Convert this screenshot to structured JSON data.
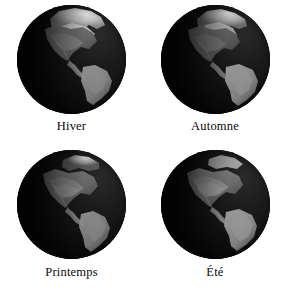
{
  "figure": {
    "background_color": "#ffffff",
    "layout": "2x2 grid of Earth globes with captions",
    "globe_count": 4
  },
  "panels": [
    {
      "id": "panel-hiver",
      "caption": "Hiver",
      "season_en": "Winter",
      "position": "top-left",
      "view": "Americas / Western Hemisphere",
      "snow_cover": "maximum",
      "description": "Globe with extensive bright white snow cover across North America and the Arctic",
      "illumination": "lit from upper right, dark limb on the left"
    },
    {
      "id": "panel-automne",
      "caption": "Automne",
      "season_en": "Autumn",
      "position": "top-right",
      "view": "Americas / Western Hemisphere",
      "snow_cover": "moderate",
      "description": "Globe with partial snow over northern Canada and the Arctic",
      "illumination": "lit from upper right, dark limb on the left"
    },
    {
      "id": "panel-printemps",
      "caption": "Printemps",
      "season_en": "Spring",
      "position": "bottom-left",
      "view": "Americas / Western Hemisphere",
      "snow_cover": "light",
      "description": "Globe with reduced snow, greening mid-latitude land",
      "illumination": "lit from upper right, dark limb on the left"
    },
    {
      "id": "panel-ete",
      "caption": "Été",
      "season_en": "Summer",
      "position": "bottom-right",
      "view": "Americas / Western Hemisphere",
      "snow_cover": "minimum",
      "description": "Globe with almost no snow cover, brightest vegetated land",
      "illumination": "lit from upper right, dark limb on the left"
    }
  ],
  "colors": {
    "background": "#ffffff",
    "caption_text": "#0a0a0a",
    "globe_night": "#020202",
    "globe_ocean": "#1a1a1a",
    "land_bright": "#cfcfcf",
    "snow_white": "#f2f2f2"
  }
}
